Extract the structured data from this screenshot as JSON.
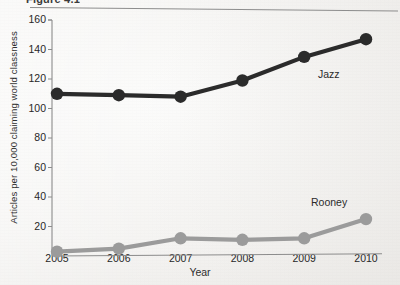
{
  "figure": {
    "caption_cutoff": "Figure 4.1",
    "has_top_rule": true
  },
  "chart_data": {
    "type": "line",
    "title": "",
    "xlabel": "Year",
    "ylabel": "Articles per 10,000 claiming world classness",
    "categories": [
      "2005",
      "2006",
      "2007",
      "2008",
      "2009",
      "2010"
    ],
    "x": [
      2005,
      2006,
      2007,
      2008,
      2009,
      2010
    ],
    "xlim": [
      2005,
      2010
    ],
    "ylim": [
      0,
      160
    ],
    "yticks": [
      20,
      40,
      60,
      80,
      100,
      120,
      140,
      160
    ],
    "grid": false,
    "legend_position": "inline-annotations",
    "series": [
      {
        "name": "Jazz",
        "color": "#2b2b2b",
        "marker": "circle",
        "values": [
          110,
          109,
          108,
          119,
          135,
          147
        ],
        "annotation": "Jazz"
      },
      {
        "name": "Rooney",
        "color": "#9b9b9b",
        "marker": "circle",
        "values": [
          3,
          5,
          12,
          11,
          12,
          25
        ],
        "annotation": "Rooney"
      }
    ]
  },
  "colors": {
    "background": "#f2f1ef",
    "axis": "#8c8c8c",
    "text": "#272727",
    "jazz": "#2b2b2b",
    "rooney": "#9b9b9b"
  }
}
